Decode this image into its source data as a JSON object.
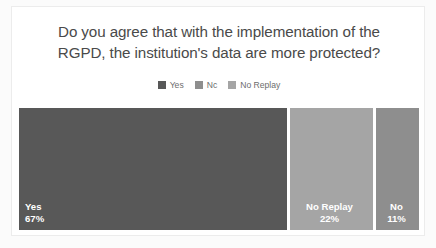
{
  "card": {
    "title_line1": "Do you agree that with the implementation of the",
    "title_line2": "RGPD, the institution's data are more protected?"
  },
  "legend": {
    "items": [
      {
        "label": "Yes",
        "color": "#585858",
        "swatch_icon": "legend-swatch-icon"
      },
      {
        "label": "Nc",
        "color": "#8e8e8e",
        "swatch_icon": "legend-swatch-icon"
      },
      {
        "label": "No Replay",
        "color": "#a5a5a5",
        "swatch_icon": "legend-swatch-icon"
      }
    ]
  },
  "chart_data": {
    "type": "bar",
    "title": "Do you agree that with the implementation of the RGPD, the institution's data are more protected?",
    "xlabel": "",
    "ylabel": "",
    "orientation": "horizontal-stacked",
    "grid": false,
    "legend_position": "top-center",
    "categories": [
      "Yes",
      "No Replay",
      "No"
    ],
    "values": [
      67,
      22,
      11
    ],
    "value_labels": [
      "67%",
      "22%",
      "11%"
    ],
    "colors": [
      "#585858",
      "#a5a5a5",
      "#8e8e8e"
    ],
    "units": "percent",
    "total": 100,
    "segments": [
      {
        "name": "Yes",
        "value": 67,
        "value_label": "67%",
        "color": "#585858"
      },
      {
        "name": "No Replay",
        "value": 22,
        "value_label": "22%",
        "color": "#a5a5a5"
      },
      {
        "name": "No",
        "value": 11,
        "value_label": "11%",
        "color": "#8e8e8e"
      }
    ]
  }
}
